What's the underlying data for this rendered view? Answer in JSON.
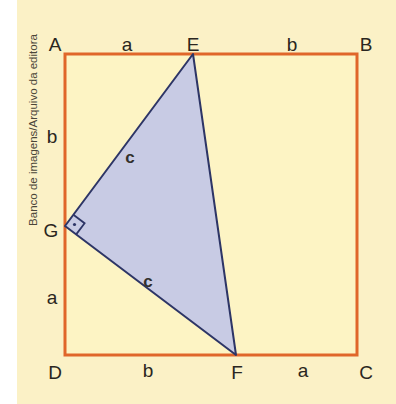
{
  "figure": {
    "type": "geometric-diagram",
    "colors": {
      "background": "#fbf1c6",
      "square_fill": "#fdf4c4",
      "square_stroke": "#e0662a",
      "triangle_fill": "#c8cbe4",
      "triangle_stroke": "#2d3566",
      "text": "#2a2620"
    },
    "vertices": {
      "A": "A",
      "B": "B",
      "C": "C",
      "D": "D",
      "E": "E",
      "F": "F",
      "G": "G"
    },
    "segment_labels": {
      "AE": "a",
      "EB": "b",
      "AG": "b",
      "GD": "a",
      "DF": "b",
      "FC": "a",
      "GE": "c",
      "GF": "c"
    },
    "right_angle_at": "G",
    "credit": "Banco de imagens/Arquivo da editora"
  }
}
